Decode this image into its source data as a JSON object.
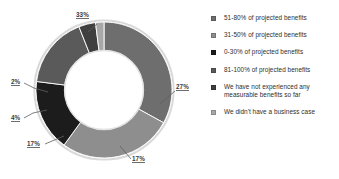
{
  "chart_data": {
    "type": "pie",
    "variant": "donut",
    "title": "",
    "subtitle": "",
    "xlabel": "",
    "ylabel": "",
    "grid": false,
    "legend_position": "right",
    "hole_ratio": 0.58,
    "categories": [
      "51-80% of projected benefits",
      "31-50% of projected benefits",
      "0-30% of projected benefits",
      "81-100% of projected benefits",
      "We have not experienced any measurable benefits so far",
      "We didn't have a business case"
    ],
    "values": [
      33,
      27,
      17,
      17,
      4,
      2
    ],
    "data_labels": [
      "33%",
      "27%",
      "17%",
      "17%",
      "4%",
      "2%"
    ],
    "colors": [
      "#6e6e6e",
      "#8e8e8e",
      "#1c1c1c",
      "#5a5a5a",
      "#3f3f3f",
      "#a8a8a8"
    ],
    "slices": [
      {
        "label": "51-80% of projected benefits",
        "value": 33,
        "data_label": "33%",
        "color": "#6e6e6e"
      },
      {
        "label": "31-50% of projected benefits",
        "value": 27,
        "data_label": "27%",
        "color": "#8e8e8e"
      },
      {
        "label": "0-30% of projected benefits",
        "value": 17,
        "data_label": "17%",
        "color": "#1c1c1c"
      },
      {
        "label": "81-100% of projected benefits",
        "value": 17,
        "data_label": "17%",
        "color": "#5a5a5a"
      },
      {
        "label": "We have not experienced any measurable benefits so far",
        "value": 4,
        "data_label": "4%",
        "color": "#3f3f3f"
      },
      {
        "label": "We didn't have a business case",
        "value": 2,
        "data_label": "2%",
        "color": "#a8a8a8"
      }
    ]
  },
  "labels": {
    "top_left": "33%",
    "right": "27%",
    "bottom_right": "17%",
    "bottom_left": "17%",
    "left_lower": "4%",
    "left_upper": "2%"
  },
  "legend": {
    "items": [
      {
        "label": "51-80% of projected benefits",
        "color": "#6e6e6e"
      },
      {
        "label": "31-50% of projected benefits",
        "color": "#8e8e8e"
      },
      {
        "label": "0-30% of projected benefits",
        "color": "#1c1c1c"
      },
      {
        "label": "81-100% of projected benefits",
        "color": "#5a5a5a"
      },
      {
        "label": "We have not experienced any measurable benefits so far",
        "color": "#3f3f3f"
      },
      {
        "label": "We didn't have a business case",
        "color": "#a8a8a8"
      }
    ]
  }
}
